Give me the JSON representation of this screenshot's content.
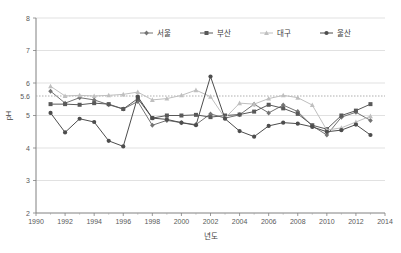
{
  "chart_data": {
    "type": "line",
    "title": "",
    "xlabel": "년도",
    "ylabel": "pH",
    "xlim": [
      1990,
      2014
    ],
    "ylim": [
      2,
      8
    ],
    "grid": true,
    "legend_position": "top-center",
    "x_ticks": [
      "1990",
      "1992",
      "1994",
      "1996",
      "1998",
      "2000",
      "2002",
      "2004",
      "2006",
      "2008",
      "2010",
      "2012",
      "2014"
    ],
    "y_ticks": [
      "2",
      "3",
      "4",
      "5",
      "6",
      "7",
      "8"
    ],
    "reference_line": {
      "value": 5.6,
      "label": "5.6",
      "style": "dotted"
    },
    "x": [
      1991,
      1992,
      1993,
      1994,
      1995,
      1996,
      1997,
      1998,
      1999,
      2000,
      2001,
      2002,
      2003,
      2004,
      2005,
      2006,
      2007,
      2008,
      2009,
      2010,
      2011,
      2012,
      2013
    ],
    "series": [
      {
        "name": "서울",
        "color": "#737373",
        "marker": "diamond",
        "values": [
          5.75,
          5.38,
          5.55,
          5.48,
          5.33,
          5.2,
          5.43,
          4.7,
          4.85,
          4.78,
          4.72,
          5.05,
          4.92,
          5.02,
          5.35,
          5.08,
          5.32,
          5.12,
          4.68,
          4.4,
          4.95,
          5.1,
          4.85
        ]
      },
      {
        "name": "부산",
        "color": "#595959",
        "marker": "square",
        "values": [
          5.35,
          5.35,
          5.33,
          5.38,
          5.35,
          5.2,
          5.52,
          4.92,
          5.0,
          5.0,
          5.02,
          4.95,
          5.0,
          5.03,
          5.12,
          5.33,
          5.22,
          5.05,
          4.7,
          4.58,
          5.0,
          5.15,
          5.35
        ]
      },
      {
        "name": "대구",
        "color": "#bfbfbf",
        "marker": "triangle",
        "values": [
          5.9,
          5.6,
          5.62,
          5.6,
          5.62,
          5.65,
          5.72,
          5.48,
          5.52,
          5.62,
          5.78,
          5.58,
          4.92,
          5.38,
          5.35,
          5.52,
          5.62,
          5.55,
          5.32,
          4.55,
          4.62,
          4.8,
          4.98
        ]
      },
      {
        "name": "울산",
        "color": "#4d4d4d",
        "marker": "circle",
        "values": [
          5.08,
          4.48,
          4.9,
          4.8,
          4.22,
          4.05,
          5.58,
          4.92,
          4.88,
          4.78,
          4.7,
          6.2,
          4.9,
          4.52,
          4.35,
          4.68,
          4.78,
          4.75,
          4.65,
          4.5,
          4.55,
          4.72,
          4.4
        ]
      }
    ]
  },
  "legend": {
    "items": [
      {
        "label": "서울"
      },
      {
        "label": "부산"
      },
      {
        "label": "대구"
      },
      {
        "label": "울산"
      }
    ]
  }
}
